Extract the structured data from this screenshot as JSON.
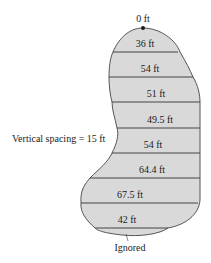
{
  "diagram": {
    "title": "",
    "top_label": "0 ft",
    "widths": [
      {
        "label": "36 ft",
        "value": 36
      },
      {
        "label": "54 ft",
        "value": 54
      },
      {
        "label": "51 ft",
        "value": 51
      },
      {
        "label": "49.5 ft",
        "value": 49.5
      },
      {
        "label": "54 ft",
        "value": 54
      },
      {
        "label": "64.4 ft",
        "value": 64.4
      },
      {
        "label": "67.5 ft",
        "value": 67.5
      },
      {
        "label": "42 ft",
        "value": 42
      }
    ],
    "spacing_label": "Vertical spacing = 15 ft",
    "ignored_label": "Ignored",
    "colors": {
      "fill": "#d9d9d9",
      "outline": "#555555",
      "lines": "#444444",
      "dot": "#1a1a1a"
    }
  }
}
